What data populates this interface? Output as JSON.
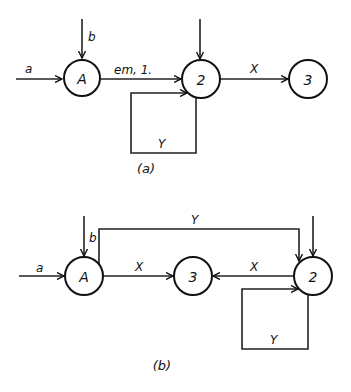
{
  "diagram_a": {
    "caption": "(a)",
    "nodes": [
      {
        "id": "A",
        "label": "A"
      },
      {
        "id": "2",
        "label": "2"
      },
      {
        "id": "3",
        "label": "3"
      }
    ],
    "edges": {
      "input_a": "a",
      "input_b": "b",
      "A_to_2": "em, 1.",
      "2_to_3": "X",
      "self_loop_2": "Y"
    }
  },
  "diagram_b": {
    "caption": "(b)",
    "nodes": [
      {
        "id": "A",
        "label": "A"
      },
      {
        "id": "3",
        "label": "3"
      },
      {
        "id": "2",
        "label": "2"
      }
    ],
    "edges": {
      "input_a": "a",
      "input_b": "b",
      "A_to_3": "X",
      "2_to_3": "X",
      "A_to_2_top": "Y",
      "self_loop_2": "Y"
    }
  },
  "colors": {
    "stroke": "#111111",
    "background": "#ffffff"
  }
}
